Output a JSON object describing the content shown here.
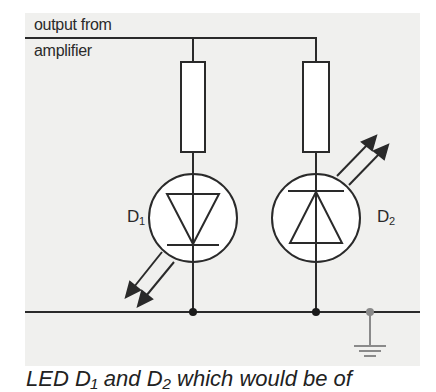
{
  "diagram": {
    "type": "circuit-schematic",
    "background": "#f0f0ee",
    "wire_color": "#2a2a2a",
    "ground_color": "#8a8a8a",
    "input_label_line1": "output from",
    "input_label_line2": "amplifier",
    "components": [
      {
        "id": "R1",
        "type": "resistor",
        "branch": "left"
      },
      {
        "id": "R2",
        "type": "resistor",
        "branch": "right"
      },
      {
        "id": "D1",
        "type": "LED",
        "label": "D",
        "subscript": "1",
        "orientation": "cathode-down",
        "light_arrows": "down-left"
      },
      {
        "id": "D2",
        "type": "LED",
        "label": "D",
        "subscript": "2",
        "orientation": "cathode-up",
        "light_arrows": "up-right"
      }
    ],
    "ground": {
      "symbol": "earth-ground"
    }
  },
  "caption": {
    "text": "LED  D₁ and D₂ which would be of"
  }
}
